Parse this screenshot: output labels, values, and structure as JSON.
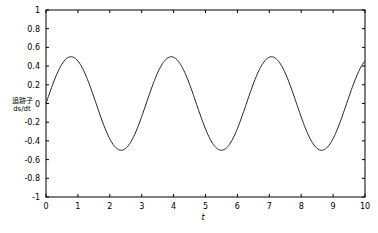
{
  "chart_data": {
    "type": "line",
    "title": "",
    "xlabel": "t",
    "ylabel": "追跡子 ds/dt",
    "ylabel_lines": [
      "追跡子",
      "ds/dt"
    ],
    "xlim": [
      0,
      10
    ],
    "ylim": [
      -1,
      1
    ],
    "grid": false,
    "legend": null,
    "xticks": [
      "0",
      "1",
      "2",
      "3",
      "4",
      "5",
      "6",
      "7",
      "8",
      "9",
      "10"
    ],
    "yticks": [
      "1",
      "0.8",
      "0.6",
      "0.4",
      "0.2",
      "0",
      "-0.2",
      "-0.4",
      "-0.6",
      "-0.8",
      "-1"
    ],
    "series": [
      {
        "name": "ds/dt",
        "function": "0.5*sin(2t)",
        "x": [
          0,
          0.5,
          0.785,
          1,
          1.5,
          2,
          2.356,
          2.5,
          3,
          3.5,
          3.927,
          4,
          4.5,
          5,
          5.498,
          6,
          6.5,
          7,
          7.069,
          7.5,
          8,
          8.5,
          8.639,
          9,
          9.5,
          10
        ],
        "y": [
          0,
          0.42,
          0.5,
          0.45,
          0.07,
          -0.38,
          -0.5,
          -0.48,
          -0.14,
          0.33,
          0.5,
          0.49,
          0.21,
          -0.27,
          -0.5,
          -0.27,
          0.21,
          0.5,
          0.5,
          0.33,
          -0.14,
          -0.48,
          -0.5,
          -0.38,
          0.07,
          0.46
        ]
      }
    ]
  }
}
